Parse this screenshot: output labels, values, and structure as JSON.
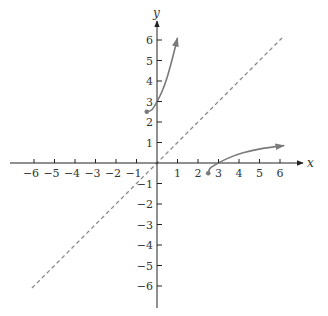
{
  "chart_data": {
    "type": "line",
    "title": "",
    "xlabel": "x",
    "ylabel": "y",
    "xlim": [
      -6.5,
      7
    ],
    "ylim": [
      -7,
      7
    ],
    "grid": false,
    "x_ticks": [
      -6,
      -5,
      -4,
      -3,
      -2,
      -1,
      1,
      2,
      3,
      4,
      5,
      6
    ],
    "y_ticks": [
      -6,
      -5,
      -4,
      -3,
      -2,
      -1,
      1,
      2,
      3,
      4,
      5,
      6
    ],
    "x_tick_labels": [
      "−6",
      "−5",
      "−4",
      "−3",
      "−2",
      "−1",
      "1",
      "2",
      "3",
      "4",
      "5",
      "6"
    ],
    "y_tick_labels": [
      "−6",
      "−5",
      "−4",
      "−3",
      "−2",
      "−1",
      "1",
      "2",
      "3",
      "4",
      "5",
      "6"
    ],
    "series": [
      {
        "name": "f",
        "style": "solid",
        "color": "#7a7a7a",
        "start_marker": "closed-dot",
        "end_marker": "arrow",
        "points": [
          [
            -0.5,
            2.5
          ],
          [
            -0.25,
            2.6
          ],
          [
            0,
            3
          ],
          [
            0.25,
            3.5
          ],
          [
            0.5,
            4.2
          ],
          [
            0.75,
            5.1
          ],
          [
            1,
            6.1
          ]
        ]
      },
      {
        "name": "f inverse",
        "style": "solid",
        "color": "#7a7a7a",
        "start_marker": "closed-dot",
        "end_marker": "arrow",
        "points": [
          [
            2.5,
            -0.5
          ],
          [
            2.6,
            -0.25
          ],
          [
            3,
            0
          ],
          [
            3.5,
            0.25
          ],
          [
            4.2,
            0.5
          ],
          [
            5.1,
            0.7
          ],
          [
            6.2,
            0.85
          ]
        ]
      },
      {
        "name": "y = x",
        "style": "dashed",
        "color": "#8a8a8a",
        "points": [
          [
            -6.1,
            -6.1
          ],
          [
            6.1,
            6.1
          ]
        ]
      }
    ]
  },
  "labels": {
    "x_axis": "x",
    "y_axis": "y"
  }
}
